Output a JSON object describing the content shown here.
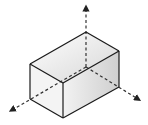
{
  "diagram": {
    "title": "",
    "colors": {
      "background": "#ffffff",
      "edge": "#1a1a1a",
      "axis": "#333333",
      "top_face_light": "#ffffff",
      "top_face_dark": "#d6d6d6",
      "left_face": "#f4f4f4",
      "right_face_light": "#f2f2f2",
      "right_face_dark": "#cfcfcf"
    },
    "box": {
      "vertices": {
        "top_back": [
          86,
          32
        ],
        "top_right": [
          119,
          51
        ],
        "top_left": [
          30,
          64
        ],
        "top_front": [
          63,
          83
        ],
        "bottom_left": [
          30,
          99
        ],
        "bottom_front": [
          63,
          118
        ],
        "bottom_right": [
          119,
          87
        ]
      }
    },
    "axes": [
      {
        "name": "vertical-axis",
        "from": [
          86,
          67
        ],
        "to": [
          86,
          8
        ]
      },
      {
        "name": "left-axis",
        "from": [
          86,
          67
        ],
        "to": [
          12,
          110
        ]
      },
      {
        "name": "right-axis",
        "from": [
          86,
          67
        ],
        "to": [
          138,
          99
        ]
      }
    ],
    "labels": []
  }
}
